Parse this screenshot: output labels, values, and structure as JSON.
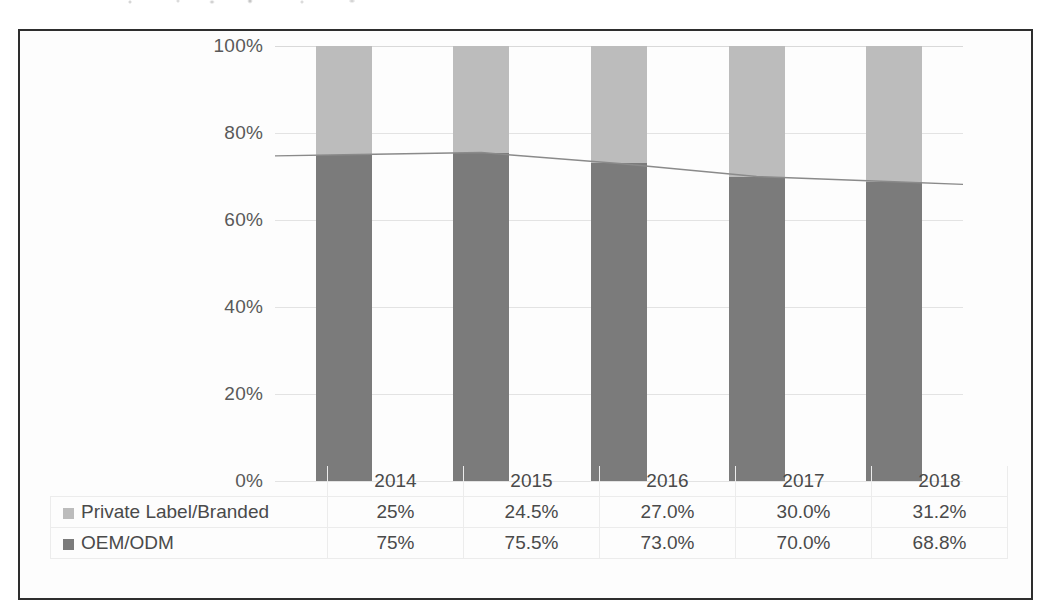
{
  "chart_data": {
    "type": "bar",
    "subtype": "stacked-bar-with-line-overlay",
    "title": "",
    "xlabel": "",
    "ylabel": "",
    "categories": [
      "2014",
      "2015",
      "2016",
      "2017",
      "2018"
    ],
    "series": [
      {
        "name": "Private Label/Branded",
        "color": "#bcbcbc",
        "marker": "light-gray-square",
        "values": [
          25,
          24.5,
          27.0,
          30.0,
          31.2
        ],
        "labels": [
          "25%",
          "24.5%",
          "27.0%",
          "30.0%",
          "31.2%"
        ]
      },
      {
        "name": "OEM/ODM",
        "color": "#7b7b7b",
        "marker": "dark-gray-square",
        "values": [
          75,
          75.5,
          73.0,
          70.0,
          68.8
        ],
        "labels": [
          "75%",
          "75.5%",
          "73.0%",
          "70.0%",
          "68.8%"
        ]
      }
    ],
    "overlay_line": {
      "name": "OEM/ODM trend",
      "color": "#8a8a8a",
      "values": [
        75,
        75.5,
        73.0,
        70.0,
        68.8
      ]
    },
    "ylim": [
      0,
      100
    ],
    "yticks": [
      0,
      20,
      40,
      60,
      80,
      100
    ],
    "ytick_labels": [
      "0%",
      "20%",
      "40%",
      "60%",
      "80%",
      "100%"
    ],
    "grid": true,
    "legend_position": "bottom-table",
    "stacked": true,
    "stack_order": [
      "OEM/ODM",
      "Private Label/Branded"
    ]
  },
  "axis": {
    "ticks": [
      "100%",
      "80%",
      "60%",
      "40%",
      "20%",
      "0%"
    ]
  },
  "table": {
    "corner_label": "",
    "years": [
      "2014",
      "2015",
      "2016",
      "2017",
      "2018"
    ],
    "rows": [
      {
        "label": "Private Label/Branded",
        "marker": "light-gray-square",
        "values": [
          "25%",
          "24.5%",
          "27.0%",
          "30.0%",
          "31.2%"
        ]
      },
      {
        "label": "OEM/ODM",
        "marker": "dark-gray-square",
        "values": [
          "75%",
          "75.5%",
          "73.0%",
          "70.0%",
          "68.8%"
        ]
      }
    ]
  },
  "colors": {
    "private_label": "#bcbcbc",
    "oem_odm": "#7b7b7b",
    "line": "#8a8a8a",
    "frame": "#2e2e2e",
    "text": "#4a4a4a",
    "grid": "#e3e3e3"
  }
}
